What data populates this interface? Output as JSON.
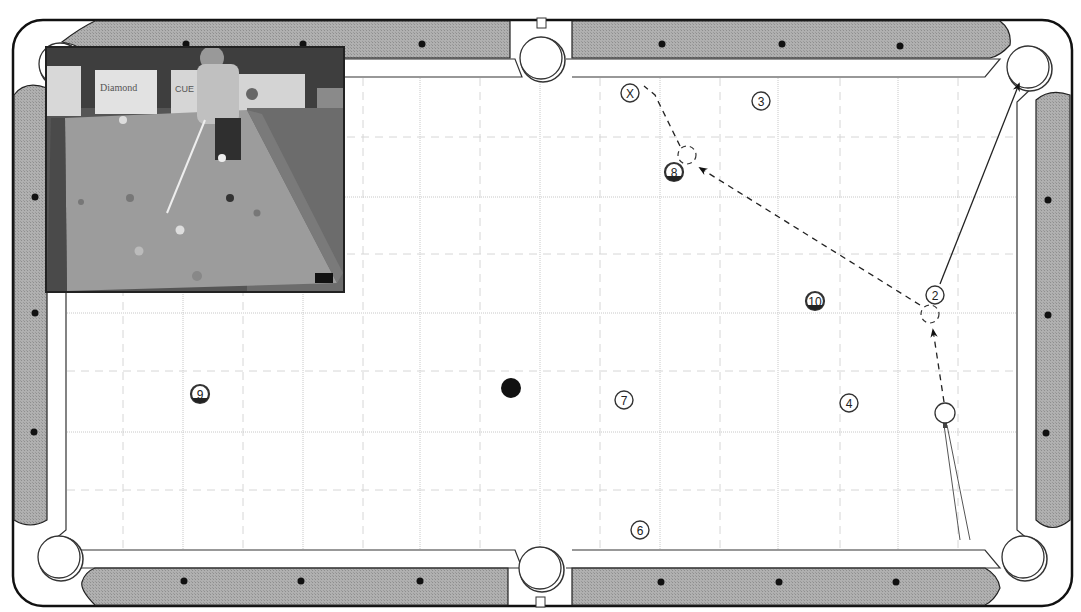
{
  "diagram": {
    "type": "pool-table-shot-diagram",
    "colors": {
      "rail": "#a9a9a9",
      "rail_outline": "#1a1a1a",
      "cushion": "#ffffff",
      "cloth": "#ffffff",
      "grid_major": "#c8c8c8",
      "grid_minor": "#d6d6d6",
      "ball_outline": "#333333",
      "object_ball_black": "#111111",
      "path_line": "#222222"
    },
    "grid": {
      "major_x": [
        183,
        303,
        420,
        540,
        660,
        778,
        898
      ],
      "minor_x": [
        123,
        243,
        363,
        480,
        600,
        720,
        840,
        958
      ],
      "major_y": [
        197,
        313,
        432
      ],
      "minor_y": [
        137,
        254,
        371,
        490
      ]
    },
    "diamonds": {
      "top": [
        [
          186,
          44
        ],
        [
          303,
          44
        ],
        [
          422,
          44
        ],
        [
          662,
          44
        ],
        [
          782,
          44
        ],
        [
          900,
          46
        ]
      ],
      "bottom": [
        [
          184,
          581
        ],
        [
          301,
          581
        ],
        [
          420,
          581
        ],
        [
          661,
          582
        ],
        [
          779,
          582
        ],
        [
          896,
          582
        ]
      ],
      "left": [
        [
          35,
          197
        ],
        [
          35,
          313
        ],
        [
          34,
          432
        ]
      ],
      "right": [
        [
          1048,
          200
        ],
        [
          1048,
          315
        ],
        [
          1046,
          433
        ]
      ]
    },
    "pockets": [
      {
        "name": "top-left",
        "cx": 60,
        "cy": 64
      },
      {
        "name": "top-middle",
        "cx": 541,
        "cy": 58
      },
      {
        "name": "top-right",
        "cx": 1028,
        "cy": 67
      },
      {
        "name": "bottom-left",
        "cx": 59,
        "cy": 557
      },
      {
        "name": "bottom-middle",
        "cx": 540,
        "cy": 568
      },
      {
        "name": "bottom-right",
        "cx": 1023,
        "cy": 557
      }
    ],
    "balls": [
      {
        "label": "X",
        "cx": 630,
        "cy": 93,
        "style": "marker"
      },
      {
        "label": "3",
        "cx": 761,
        "cy": 101,
        "style": "solid"
      },
      {
        "label": "8",
        "cx": 674,
        "cy": 172,
        "style": "stripe"
      },
      {
        "label": "10",
        "cx": 815,
        "cy": 301,
        "style": "stripe"
      },
      {
        "label": "2",
        "cx": 935,
        "cy": 295,
        "style": "solid"
      },
      {
        "label": "9",
        "cx": 200,
        "cy": 394,
        "style": "stripe"
      },
      {
        "label": "7",
        "cx": 624,
        "cy": 400,
        "style": "solid"
      },
      {
        "label": "4",
        "cx": 849,
        "cy": 403,
        "style": "solid"
      },
      {
        "label": "6",
        "cx": 640,
        "cy": 530,
        "style": "solid"
      }
    ],
    "black_ball": {
      "cx": 511,
      "cy": 388,
      "r": 10
    },
    "cue_ball": {
      "cx": 945,
      "cy": 413,
      "r": 10
    },
    "ghost_balls": [
      {
        "cx": 687,
        "cy": 155
      },
      {
        "cx": 930,
        "cy": 314
      }
    ],
    "paths": {
      "cue_to_ghost_2": {
        "style": "dashed",
        "points": [
          [
            944,
            402
          ],
          [
            933,
            330
          ]
        ],
        "arrow": true
      },
      "ghost2_to_ghost8": {
        "style": "dashed",
        "points": [
          [
            920,
            305
          ],
          [
            700,
            168
          ]
        ],
        "arrow": true
      },
      "ghost8_to_x": {
        "style": "dashed",
        "points": [
          [
            680,
            146
          ],
          [
            655,
            95
          ],
          [
            644,
            86
          ]
        ],
        "arrow": false
      },
      "ball2_to_pocket": {
        "style": "solid",
        "points": [
          [
            940,
            284
          ],
          [
            1019,
            84
          ]
        ],
        "arrow": true
      }
    },
    "cue_stick": {
      "tip": [
        945,
        425
      ],
      "butt_left": [
        960,
        540
      ],
      "butt_right": [
        970,
        540
      ]
    },
    "inset_photo": {
      "description": "Photo of player shooting on pool table with sponsor banners",
      "banner_texts": [
        "Diamond",
        "CUE",
        "Pool"
      ]
    }
  }
}
